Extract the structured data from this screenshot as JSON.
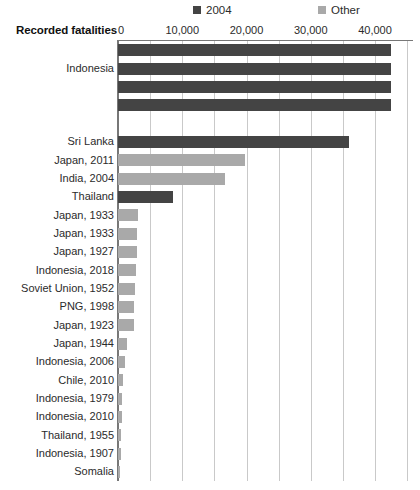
{
  "chart_data": {
    "type": "bar",
    "orientation": "horizontal",
    "title": "",
    "xlabel": "Recorded fatalities",
    "ylabel": "",
    "xlim": [
      0,
      45000
    ],
    "xticks": [
      0,
      10000,
      20000,
      30000,
      40000
    ],
    "xticklabels": [
      "0",
      "10,000",
      "20,000",
      "30,000",
      "40,000"
    ],
    "gridlines_every": 5000,
    "grid": true,
    "legend": {
      "position": "top",
      "entries": [
        {
          "name": "2004",
          "color": "#444444"
        },
        {
          "name": "Other",
          "color": "#a9a9a9"
        }
      ]
    },
    "categories": [
      "Indonesia",
      "Indonesia",
      "Indonesia",
      "Indonesia",
      "",
      "Sri Lanka",
      "Japan, 2011",
      "India, 2004",
      "Thailand",
      "Japan, 1933",
      "Japan, 1933",
      "Japan, 1927",
      "Indonesia, 2018",
      "Soviet Union, 1952",
      "PNG, 1998",
      "Japan, 1923",
      "Japan, 1944",
      "Indonesia, 2006",
      "Chile, 2010",
      "Indonesia, 1979",
      "Indonesia, 2010",
      "Thailand, 1955",
      "Indonesia, 1907",
      "Somalia"
    ],
    "label_display": [
      "",
      "Indonesia",
      "",
      "",
      "",
      "Sri Lanka",
      "Japan, 2011",
      "India, 2004",
      "Thailand",
      "Japan, 1933",
      "Japan, 1933",
      "Japan, 1927",
      "Indonesia, 2018",
      "Soviet Union, 1952",
      "PNG, 1998",
      "Japan, 1923",
      "Japan, 1944",
      "Indonesia, 2006",
      "Chile, 2010",
      "Indonesia, 1979",
      "Indonesia, 2010",
      "Thailand, 1955",
      "Indonesia, 1907",
      "Somalia"
    ],
    "values": [
      42500,
      42500,
      42500,
      42500,
      0,
      36000,
      19800,
      16700,
      8500,
      3050,
      3000,
      2950,
      2800,
      2600,
      2500,
      2450,
      1400,
      1100,
      800,
      700,
      600,
      500,
      430,
      300
    ],
    "series_of": [
      "2004",
      "2004",
      "2004",
      "2004",
      "",
      "2004",
      "Other",
      "Other",
      "2004",
      "Other",
      "Other",
      "Other",
      "Other",
      "Other",
      "Other",
      "Other",
      "Other",
      "Other",
      "Other",
      "Other",
      "Other",
      "Other",
      "Other",
      "Other"
    ]
  },
  "colors": {
    "series_2004": "#444444",
    "series_other": "#a9a9a9",
    "gridline": "#c9c9c9",
    "axis": "#777777",
    "text": "#2b2b2b"
  }
}
